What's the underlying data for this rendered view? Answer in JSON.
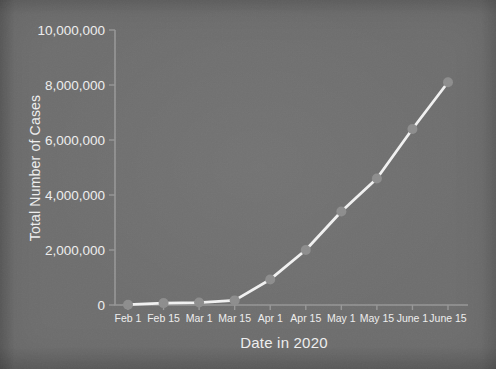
{
  "figure": {
    "kind": "presentation-slide-chart",
    "background_color": "#6e6e6e"
  },
  "chart_data": {
    "type": "line",
    "title": "",
    "xlabel": "Date in 2020",
    "ylabel": "Total Number of Cases",
    "categories": [
      "Feb 1",
      "Feb 15",
      "Mar 1",
      "Mar 15",
      "Apr 1",
      "Apr 15",
      "May 1",
      "May 15",
      "June 1",
      "June 15"
    ],
    "values": [
      12000,
      69000,
      88000,
      167000,
      930000,
      2000000,
      3400000,
      4600000,
      6400000,
      8100000
    ],
    "series_name": "Total cases",
    "ylim": [
      0,
      10000000
    ],
    "y_ticks": [
      0,
      2000000,
      4000000,
      6000000,
      8000000,
      10000000
    ],
    "y_tick_labels": [
      "0",
      "2,000,000",
      "4,000,000",
      "6,000,000",
      "8,000,000",
      "10,000,000"
    ],
    "grid": false,
    "legend": false,
    "marker": "circle",
    "line_color": "#f2f2f2",
    "marker_color": "#8d8d8d",
    "axis_color": "#979797",
    "text_color": "#efefef"
  }
}
